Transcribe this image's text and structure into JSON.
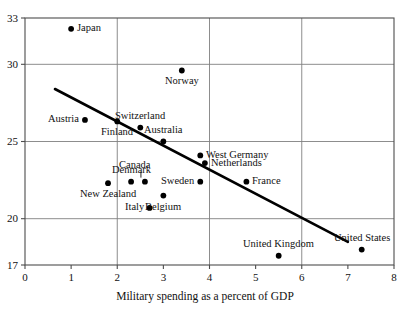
{
  "chart_data": {
    "type": "scatter",
    "title": "",
    "xlabel": "Military spending as a percent of GDP",
    "ylabel": "",
    "xlim": [
      0,
      8
    ],
    "ylim": [
      17,
      33
    ],
    "xticks": [
      "0",
      "1",
      "2",
      "3",
      "4",
      "5",
      "6",
      "7",
      "8"
    ],
    "yticks": [
      "17",
      "20",
      "25",
      "30",
      "33"
    ],
    "grid": "major gridlines at x = 2, 4, 6 and y = 20, 25, 30",
    "legend": "none",
    "points": [
      {
        "label": "Japan",
        "x": 1.0,
        "y": 32.3,
        "label_pos": "right"
      },
      {
        "label": "Norway",
        "x": 3.4,
        "y": 29.6,
        "label_pos": "below"
      },
      {
        "label": "Austria",
        "x": 1.3,
        "y": 26.4,
        "label_pos": "left"
      },
      {
        "label": "Switzerland",
        "x": 2.5,
        "y": 25.9,
        "label_pos": "above"
      },
      {
        "label": "Finland",
        "x": 2.0,
        "y": 26.3,
        "label_pos": "below"
      },
      {
        "label": "Australia",
        "x": 3.0,
        "y": 25.0,
        "label_pos": "above"
      },
      {
        "label": "West Germany",
        "x": 3.8,
        "y": 24.1,
        "label_pos": "right"
      },
      {
        "label": "Netherlands",
        "x": 3.9,
        "y": 23.6,
        "label_pos": "right"
      },
      {
        "label": "Canada",
        "x": 2.6,
        "y": 22.4,
        "label_pos": "leader-up-left"
      },
      {
        "label": "Denmark",
        "x": 2.3,
        "y": 22.4,
        "label_pos": "above"
      },
      {
        "label": "Sweden",
        "x": 3.8,
        "y": 22.4,
        "label_pos": "left"
      },
      {
        "label": "France",
        "x": 4.8,
        "y": 22.4,
        "label_pos": "right"
      },
      {
        "label": "New Zealand",
        "x": 1.8,
        "y": 22.3,
        "label_pos": "below"
      },
      {
        "label": "Belgium",
        "x": 3.0,
        "y": 21.5,
        "label_pos": "below"
      },
      {
        "label": "Italy",
        "x": 2.7,
        "y": 20.7,
        "label_pos": "left"
      },
      {
        "label": "United Kingdom",
        "x": 5.5,
        "y": 17.6,
        "label_pos": "above"
      },
      {
        "label": "United States",
        "x": 7.3,
        "y": 18.0,
        "label_pos": "above"
      }
    ],
    "trendline": {
      "x_start": 0.65,
      "y_start": 28.4,
      "x_end": 7.0,
      "y_end": 18.5,
      "color": "#000000"
    },
    "colors": {
      "marker": "#000000",
      "axis": "#4d4d4d",
      "grid": "#808080",
      "text": "#111111"
    }
  }
}
